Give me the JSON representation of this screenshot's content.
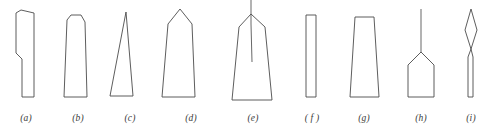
{
  "figure": {
    "kind": "line-drawing-plate",
    "background_color": "#ffffff",
    "stroke_color": "#4b4b4b",
    "fill_color": "#ffffff",
    "canvas": {
      "width": 487,
      "height": 129
    },
    "label_row_y": 112,
    "shapes": [
      {
        "id": "a",
        "label": "(a)",
        "label_x": 26,
        "name": "angled-tip-notched-blade",
        "outline": "21,10 34,13 34,97 22,97 22,59 16,53 16,13",
        "spine": ""
      },
      {
        "id": "b",
        "label": "(b)",
        "label_x": 78,
        "name": "chamfered-top-bar",
        "outline": "67,20 71,15 81,15 85,22 87,97 64,97",
        "spine": ""
      },
      {
        "id": "c",
        "label": "(c)",
        "label_x": 130,
        "name": "narrow-triangular-wedge",
        "outline": "126,12 133,96 110,96",
        "spine": ""
      },
      {
        "id": "d",
        "label": "(d)",
        "label_x": 191,
        "name": "gabled-tip-tapered-blade",
        "outline": "180,9 192,24 195,97 162,97 168,24",
        "spine": ""
      },
      {
        "id": "e",
        "label": "(e)",
        "label_x": 253,
        "name": "spined-gabled-tip-blade",
        "outline": "251,14 265,27 272,100 232,100 239,27",
        "spine": "251,0 251,14 251,24 252,62"
      },
      {
        "id": "f",
        "label": "( f )",
        "label_x": 312,
        "name": "plain-narrow-rectangle",
        "outline": "306,15 316,15 316,97 306,97",
        "spine": ""
      },
      {
        "id": "g",
        "label": "(g)",
        "label_x": 364,
        "name": "flat-top-trapezoid",
        "outline": "355,17 374,17 379,97 350,97",
        "spine": ""
      },
      {
        "id": "h",
        "label": "(h)",
        "label_x": 421,
        "name": "pointed-top-bar-with-tang",
        "outline": "421,52 434,65 434,97 408,97 408,65",
        "spine": "421,9 421,52"
      },
      {
        "id": "i",
        "label": "(i)",
        "label_x": 471,
        "name": "leaf-blade-on-shaft",
        "outline": "471,9 477,30 471,49 468,57 468,97 473,97 473,57 471,49 465,30",
        "spine": ""
      }
    ]
  }
}
